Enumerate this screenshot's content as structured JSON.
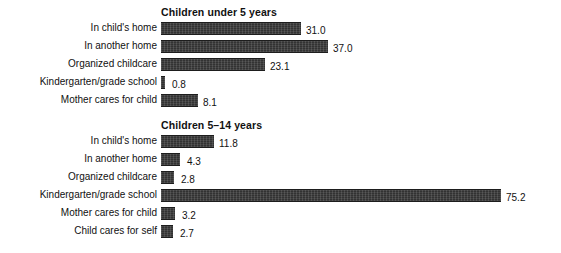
{
  "chart_data": [
    {
      "type": "bar",
      "orientation": "horizontal",
      "title": "Children under 5 years",
      "xlabel": "",
      "ylabel": "",
      "grid": false,
      "legend": false,
      "xlim": [
        0,
        80
      ],
      "value_label_format": "one-decimal",
      "categories": [
        "In child's home",
        "In another home",
        "Organized childcare",
        "Kindergarten/grade school",
        "Mother cares for child"
      ],
      "values": [
        31.0,
        37.0,
        23.1,
        0.8,
        8.1
      ],
      "value_labels": [
        "31.0",
        "37.0",
        "23.1",
        "0.8",
        "8.1"
      ]
    },
    {
      "type": "bar",
      "orientation": "horizontal",
      "title": "Children 5–14 years",
      "xlabel": "",
      "ylabel": "",
      "grid": false,
      "legend": false,
      "xlim": [
        0,
        80
      ],
      "value_label_format": "one-decimal",
      "categories": [
        "In child's home",
        "In another home",
        "Organized childcare",
        "Kindergarten/grade school",
        "Mother cares for child",
        "Child cares for self"
      ],
      "values": [
        11.8,
        4.3,
        2.8,
        75.2,
        3.2,
        2.7
      ],
      "value_labels": [
        "11.8",
        "4.3",
        "2.8",
        "75.2",
        "3.2",
        "2.7"
      ]
    }
  ],
  "style": {
    "bar_color": "#353535",
    "bar_edge_color": "#1d1d1d",
    "text_color": "#111111",
    "background": "#ffffff"
  }
}
